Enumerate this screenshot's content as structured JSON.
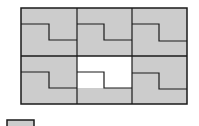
{
  "diagram": {
    "type": "figure-matrix-puzzle",
    "rows": 2,
    "cols": 3,
    "fill_color": "#cccccc",
    "line_color": "#1a1a1a",
    "background": "#ffffff",
    "cells": [
      {
        "row": 0,
        "col": 0,
        "content": "step-shape"
      },
      {
        "row": 0,
        "col": 1,
        "content": "step-shape"
      },
      {
        "row": 0,
        "col": 2,
        "content": "step-shape"
      },
      {
        "row": 1,
        "col": 0,
        "content": "step-shape"
      },
      {
        "row": 1,
        "col": 1,
        "content": "missing-piece"
      },
      {
        "row": 1,
        "col": 2,
        "content": "step-shape"
      }
    ],
    "answer_option": {
      "label": "",
      "fill": "#cccccc"
    }
  }
}
